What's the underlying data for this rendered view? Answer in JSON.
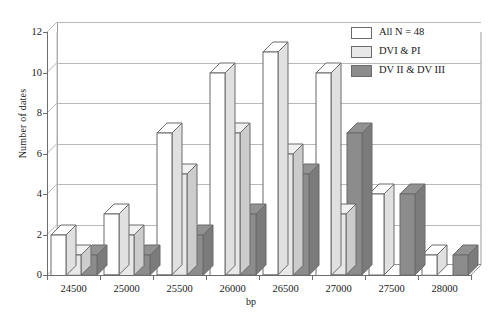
{
  "chart_data": {
    "type": "bar",
    "title": "",
    "subtitle": "",
    "xlabel": "bp",
    "ylabel": "Number of dates",
    "categories": [
      "24500",
      "25000",
      "25500",
      "26000",
      "26500",
      "27000",
      "27500",
      "28000"
    ],
    "series": [
      {
        "name": "All N = 48",
        "color": "#ffffff",
        "values": [
          2,
          3,
          7,
          10,
          11,
          10,
          4,
          1
        ]
      },
      {
        "name": "DVI & PI",
        "color": "#e8e8e8",
        "values": [
          1,
          2,
          5,
          7,
          6,
          3,
          0,
          0
        ]
      },
      {
        "name": "DV II & DV III",
        "color": "#8c8c8c",
        "values": [
          1,
          1,
          2,
          3,
          5,
          7,
          4,
          1
        ]
      }
    ],
    "ylim": [
      0,
      12
    ],
    "yticks": [
      0,
      2,
      4,
      6,
      8,
      10,
      12
    ],
    "ytick_labels": [
      "0",
      "2",
      "4",
      "6",
      "8",
      "10",
      "12"
    ],
    "grid": true,
    "legend_position": "top-right",
    "style": "3d-grouped-columns"
  },
  "axes": {
    "y_title": "Number of dates",
    "x_title": "bp"
  },
  "legend": {
    "entries": [
      {
        "label": "All N = 48",
        "color": "#ffffff"
      },
      {
        "label": "DVI & PI",
        "color": "#e8e8e8"
      },
      {
        "label": "DV II & DV III",
        "color": "#8c8c8c"
      }
    ]
  },
  "colors": {
    "series_all": "#ffffff",
    "series_dvi_pi": "#e8e8e8",
    "series_dv2_dv3": "#8c8c8c",
    "axis": "#6d6d6d",
    "grid": "#b9b9b9",
    "bar_outline": "#6b6b6b",
    "background": "#ffffff"
  }
}
